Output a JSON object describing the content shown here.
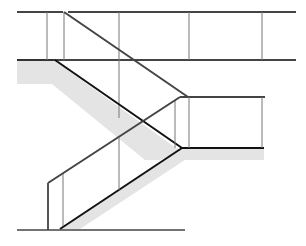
{
  "figure": {
    "title": "Switchback staircase with railings (elevation line drawing)",
    "colors": {
      "background": "#ffffff",
      "line_dark": "#222222",
      "line_rail": "#555555",
      "post": "#777777",
      "shade": "#e4e4e4"
    },
    "components": [
      "top-rail",
      "upper-landing",
      "upper-flight",
      "upper-handrail",
      "middle-landing",
      "lower-flight",
      "lower-handrail",
      "ground-line",
      "posts"
    ]
  }
}
